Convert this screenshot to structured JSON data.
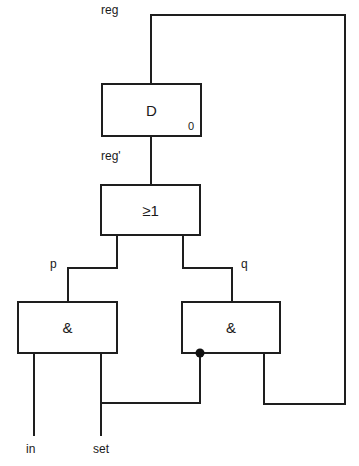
{
  "diagram": {
    "type": "logic-circuit",
    "signals": {
      "reg": "reg",
      "reg_prime": "reg'",
      "p": "p",
      "q": "q",
      "in": "in",
      "set": "set"
    },
    "gates": {
      "flipflop": {
        "symbol": "D",
        "init_label": "0"
      },
      "or_gate": {
        "symbol": "≥1"
      },
      "and_left": {
        "symbol": "&"
      },
      "and_right": {
        "symbol": "&",
        "negated_input": "set"
      }
    },
    "colors": {
      "line": "#1e1e1e",
      "background": "#ffffff"
    }
  }
}
